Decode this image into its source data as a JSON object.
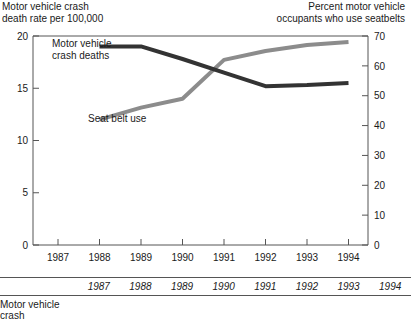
{
  "chart_data": {
    "type": "line",
    "title": "",
    "x": [
      1987,
      1988,
      1989,
      1990,
      1991,
      1992,
      1993,
      1994
    ],
    "xlabel": "",
    "xtick_labels": [
      "1987",
      "1988",
      "1989",
      "1990",
      "1991",
      "1992",
      "1993",
      "1994"
    ],
    "grid": false,
    "legend": "inline-annotations",
    "axes": [
      {
        "side": "left",
        "label": "Motor vehicle crash\ndeath rate per 100,000",
        "ylim": [
          0,
          20
        ],
        "ticks": [
          0,
          5,
          10,
          15,
          20
        ],
        "tick_labels": [
          "0",
          "5",
          "10",
          "15",
          "20"
        ]
      },
      {
        "side": "right",
        "label": "Percent motor vehicle\noccupants who use seatbelts",
        "ylim": [
          0,
          70
        ],
        "ticks": [
          0,
          10,
          20,
          30,
          40,
          50,
          60,
          70
        ],
        "tick_labels": [
          "0",
          "10",
          "20",
          "30",
          "40",
          "50",
          "60",
          "70"
        ]
      }
    ],
    "series": [
      {
        "name": "Motor vehicle crash deaths",
        "axis": "left",
        "color": "#333333",
        "label_text": "Motor vehicle\ncrash deaths",
        "x": [
          1988,
          1989,
          1990,
          1991,
          1992,
          1993,
          1994
        ],
        "values": [
          19.0,
          19.0,
          17.8,
          16.5,
          15.2,
          15.3,
          15.5
        ]
      },
      {
        "name": "Seat belt use",
        "axis": "right",
        "color": "#8c8c8c",
        "label_text": "Seat belt use",
        "x": [
          1988,
          1989,
          1990,
          1991,
          1992,
          1993,
          1994
        ],
        "values": [
          42,
          46,
          49,
          62,
          65,
          67,
          68
        ]
      }
    ]
  },
  "bottom_table": {
    "rowhead_blank": "",
    "columns": [
      "1987",
      "1988",
      "1989",
      "1990",
      "1991",
      "1992",
      "1993",
      "1994"
    ],
    "rows": [
      {
        "label": "Motor vehicle crash",
        "cells": [
          "",
          "",
          "",
          "",
          "",
          "",
          "",
          ""
        ]
      }
    ]
  },
  "colors": {
    "deaths_line": "#333333",
    "seatbelt_line": "#8c8c8c",
    "axis": "#555555",
    "text": "#1a1a1a"
  }
}
